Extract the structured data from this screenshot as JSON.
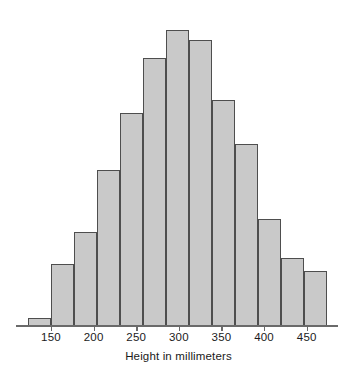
{
  "chart_data": {
    "type": "bar",
    "title": "",
    "subtitle": "",
    "xlabel": "Height in millimeters",
    "ylabel": "",
    "grid": false,
    "legend": null,
    "xlim": [
      123,
      475
    ],
    "ylim": [
      0,
      120
    ],
    "bin_width": 27,
    "tick_labels": [
      "150",
      "200",
      "250",
      "300",
      "350",
      "400",
      "450"
    ],
    "tick_values": [
      150,
      200,
      250,
      300,
      350,
      400,
      450
    ],
    "bin_starts": [
      123,
      150,
      177,
      204,
      231,
      258,
      285,
      312,
      339,
      366,
      393,
      420,
      447
    ],
    "bin_ends": [
      150,
      177,
      204,
      231,
      258,
      285,
      312,
      339,
      366,
      393,
      420,
      447,
      474
    ],
    "bin_centers": [
      136,
      163,
      190,
      217,
      244,
      271,
      298,
      325,
      352,
      379,
      406,
      433,
      460
    ],
    "categories": [
      "123-150",
      "150-177",
      "177-204",
      "204-231",
      "231-258",
      "258-285",
      "285-312",
      "312-339",
      "339-366",
      "366-393",
      "393-420",
      "420-447",
      "447-474"
    ],
    "values": [
      3,
      24,
      36,
      60,
      82,
      103,
      114,
      110,
      87,
      70,
      41,
      26,
      21
    ],
    "axis_color": "#6a6a6a",
    "bar_fill": "#c9c9c9",
    "bar_stroke": "#4e4e4e",
    "text_color": "#1a1a1a"
  },
  "chart_meta": {
    "icon_name": "bar-chart-icon"
  }
}
